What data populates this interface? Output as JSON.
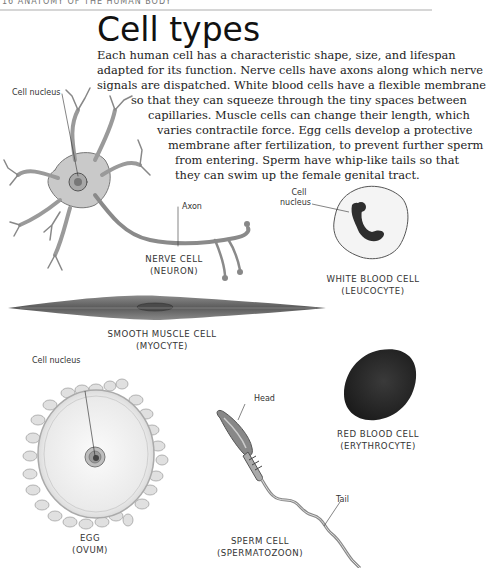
{
  "header": {
    "running_head": "16  ANATOMY OF THE HUMAN BODY"
  },
  "page": {
    "title": "Cell types",
    "body_lines": [
      "Each human cell has a characteristic shape, size, and lifespan",
      "adapted for its function. Nerve cells have axons along which nerve",
      "signals are dispatched. White blood cells have a flexible membrane",
      "so that they can squeeze through the tiny spaces between",
      "capillaries. Muscle cells can change their length, which",
      "varies contractile force. Egg cells develop a protective",
      "membrane after fertilization, to prevent further sperm",
      "from entering. Sperm have whip-like tails so that",
      "they can swim up the female genital tract."
    ]
  },
  "cells": {
    "nerve": {
      "caption_line1": "NERVE CELL",
      "caption_line2": "(NEURON)",
      "labels": {
        "nucleus": "Cell nucleus",
        "axon": "Axon"
      }
    },
    "white_blood": {
      "caption_line1": "WHITE BLOOD CELL",
      "caption_line2": "(LEUCOCYTE)",
      "labels": {
        "nucleus_line1": "Cell",
        "nucleus_line2": "nucleus"
      }
    },
    "smooth_muscle": {
      "caption_line1": "SMOOTH MUSCLE CELL",
      "caption_line2": "(MYOCYTE)"
    },
    "egg": {
      "caption_line1": "EGG",
      "caption_line2": "(OVUM)",
      "labels": {
        "nucleus": "Cell nucleus"
      }
    },
    "red_blood": {
      "caption_line1": "RED BLOOD CELL",
      "caption_line2": "(ERYTHROCYTE)"
    },
    "sperm": {
      "caption_line1": "SPERM CELL",
      "caption_line2": "(SPERMATOZOON)",
      "labels": {
        "head": "Head",
        "tail": "Tail"
      }
    }
  },
  "colors": {
    "ink": "#222222",
    "cell_grey": "#9a9a9a",
    "red_blood_cell": "#2a2a2a"
  }
}
